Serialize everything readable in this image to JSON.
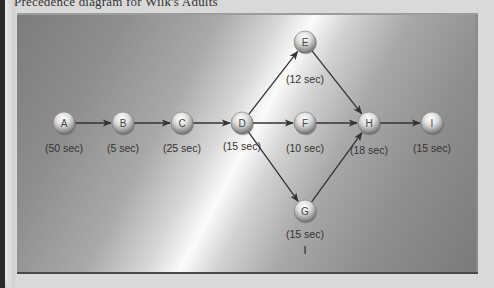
{
  "title": "Precedence diagram for Wilk's Adults",
  "colors": {
    "edge": "#333333",
    "node_fill_light": "#f4f4f4",
    "node_fill_dark": "#8a8a8a",
    "label_text": "#333333"
  },
  "diagram": {
    "nodes": [
      {
        "id": "A",
        "label": "A",
        "duration": "(50 sec)",
        "x": 64,
        "y": 123,
        "lx": 64,
        "ly": 152
      },
      {
        "id": "B",
        "label": "B",
        "duration": "(5 sec)",
        "x": 123,
        "y": 123,
        "lx": 123,
        "ly": 152
      },
      {
        "id": "C",
        "label": "C",
        "duration": "(25 sec)",
        "x": 182,
        "y": 123,
        "lx": 182,
        "ly": 152
      },
      {
        "id": "D",
        "label": "D",
        "duration": "(15 sec)",
        "x": 242,
        "y": 123,
        "lx": 242,
        "ly": 150
      },
      {
        "id": "E",
        "label": "E",
        "duration": "(12 sec)",
        "x": 305,
        "y": 42,
        "lx": 305,
        "ly": 83
      },
      {
        "id": "F",
        "label": "F",
        "duration": "(10 sec)",
        "x": 305,
        "y": 123,
        "lx": 305,
        "ly": 152
      },
      {
        "id": "G",
        "label": "G",
        "duration": "(15 sec)",
        "x": 305,
        "y": 211,
        "lx": 305,
        "ly": 238
      },
      {
        "id": "H",
        "label": "H",
        "duration": "(18 sec)",
        "x": 369,
        "y": 123,
        "lx": 369,
        "ly": 154
      },
      {
        "id": "I",
        "label": "I",
        "duration": "(15 sec)",
        "x": 432,
        "y": 123,
        "lx": 432,
        "ly": 152
      }
    ],
    "edges": [
      {
        "from": "A",
        "to": "B"
      },
      {
        "from": "B",
        "to": "C"
      },
      {
        "from": "C",
        "to": "D"
      },
      {
        "from": "D",
        "to": "E"
      },
      {
        "from": "D",
        "to": "F"
      },
      {
        "from": "D",
        "to": "G"
      },
      {
        "from": "E",
        "to": "H"
      },
      {
        "from": "F",
        "to": "H"
      },
      {
        "from": "G",
        "to": "H"
      },
      {
        "from": "H",
        "to": "I"
      }
    ],
    "cursor_glyph": "I"
  }
}
